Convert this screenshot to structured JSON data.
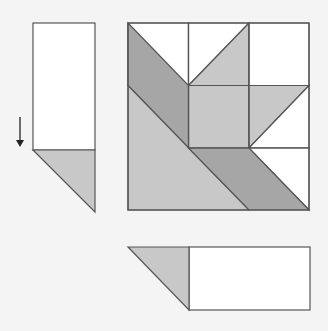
{
  "colors": {
    "background": "#f4f4f4",
    "white": "#ffffff",
    "light_gray": "#c8c8c8",
    "dark_gray": "#a6a6a6",
    "stroke": "#555555",
    "arrow": "#222222"
  },
  "left_piece": {
    "rect": {
      "x": 33,
      "y": 23,
      "w": 62,
      "h": 127,
      "fill": "white"
    },
    "triangle": {
      "points": "33,150 95,150 95,212",
      "fill": "light_gray"
    }
  },
  "arrow": {
    "x": 20,
    "y1": 117,
    "y2": 147,
    "direction": "down"
  },
  "quilt_block": {
    "origin": [
      128,
      23
    ],
    "size": 181,
    "grid": 3,
    "shapes": [
      {
        "name": "top-left-cell",
        "points": "128,23 188.5,23 188.5,85.5 128,85.5",
        "fill": "white"
      },
      {
        "name": "top-middle-white-triangle",
        "points": "188.5,23 249,23 188.5,85.5",
        "fill": "white"
      },
      {
        "name": "top-middle-gray-triangle",
        "points": "249,23 249,85.5 188.5,85.5",
        "fill": "light_gray"
      },
      {
        "name": "top-right-cell",
        "points": "249,23 309,23 309,85.5 249,85.5",
        "fill": "white"
      },
      {
        "name": "center-square",
        "points": "188.5,85.5 249,85.5 249,148 188.5,148",
        "fill": "light_gray"
      },
      {
        "name": "right-middle-gray-triangle",
        "points": "249,85.5 309,85.5 249,148",
        "fill": "light_gray"
      },
      {
        "name": "right-middle-white-triangle",
        "points": "309,85.5 309,148 249,148",
        "fill": "white"
      },
      {
        "name": "bottom-right-white",
        "points": "249,148 309,148 309,210",
        "fill": "white"
      },
      {
        "name": "upper-dark-band",
        "points": "128,23 188.5,85.5 188.5,148 128,85.5",
        "fill": "dark_gray"
      },
      {
        "name": "large-light-triangle",
        "points": "128,85.5 249,210 128,210",
        "fill": "light_gray"
      },
      {
        "name": "lower-dark-band",
        "points": "188.5,148 249,148 309,210 249,210",
        "fill": "dark_gray"
      }
    ],
    "grid_lines": [
      {
        "x1": 188.5,
        "y1": 23,
        "x2": 188.5,
        "y2": 148
      },
      {
        "x1": 249,
        "y1": 23,
        "x2": 249,
        "y2": 148
      },
      {
        "x1": 188.5,
        "y1": 85.5,
        "x2": 309,
        "y2": 85.5
      },
      {
        "x1": 188.5,
        "y1": 148,
        "x2": 309,
        "y2": 148
      }
    ]
  },
  "bottom_piece": {
    "triangle": {
      "points": "128,247 189,247 189,310",
      "fill": "light_gray"
    },
    "rect": {
      "x": 189,
      "y": 247,
      "w": 121,
      "h": 63,
      "fill": "white"
    }
  }
}
